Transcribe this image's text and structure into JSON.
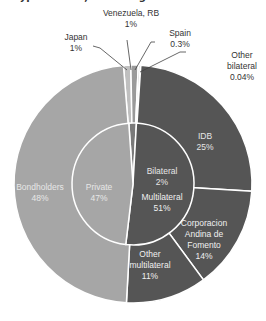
{
  "title_partial": "... type of debt, excluding IMF credit",
  "chart_data": {
    "type": "pie",
    "subtype": "nested-donut",
    "title": "",
    "inner": [
      {
        "label": "Private",
        "value": 47,
        "display": "47%",
        "color": "#a6a6a6"
      },
      {
        "label": "Bilateral",
        "value": 2,
        "display": "2%",
        "color": "#7a7a7a"
      },
      {
        "label": "Multilateral",
        "value": 51,
        "display": "51%",
        "color": "#555555"
      }
    ],
    "outer": [
      {
        "label": "Bondholders",
        "value": 48,
        "display": "48%",
        "color": "#a6a6a6",
        "parent": "Private"
      },
      {
        "label": "Japan",
        "value": 1,
        "display": "1%",
        "color": "#bfbfbf",
        "parent": "Bilateral"
      },
      {
        "label": "Venezuela, RB",
        "value": 1,
        "display": "1%",
        "color": "#9a9a9a",
        "parent": "Bilateral"
      },
      {
        "label": "Spain",
        "value": 0.3,
        "display": "0.3%",
        "color": "#cfcfcf",
        "parent": "Bilateral"
      },
      {
        "label": "Other bilateral",
        "value": 0.04,
        "display": "0.04%",
        "color": "#888888",
        "parent": "Bilateral"
      },
      {
        "label": "IDB",
        "value": 25,
        "display": "25%",
        "color": "#555555",
        "parent": "Multilateral"
      },
      {
        "label": "Corporacion Andina de Fomento",
        "value": 14,
        "display": "14%",
        "color": "#555555",
        "parent": "Multilateral"
      },
      {
        "label": "Other multilateral",
        "value": 11,
        "display": "11%",
        "color": "#555555",
        "parent": "Multilateral"
      }
    ],
    "legend": "none",
    "labels": {
      "bondholders": [
        "Bondholders",
        "48%"
      ],
      "private": [
        "Private",
        "47%"
      ],
      "bilateral": [
        "Bilateral",
        "2%"
      ],
      "multilateral": [
        "Multilateral",
        "51%"
      ],
      "idb": [
        "IDB",
        "25%"
      ],
      "caf": [
        "Corporacion",
        "Andina de",
        "Fomento",
        "14%"
      ],
      "other_multilateral": [
        "Other",
        "multilateral",
        "11%"
      ],
      "japan": [
        "Japan",
        "1%"
      ],
      "venezuela": [
        "Venezuela, RB",
        "1%"
      ],
      "spain": [
        "Spain",
        "0.3%"
      ],
      "other_bilateral": [
        "Other",
        "bilateral",
        "0.04%"
      ]
    }
  }
}
